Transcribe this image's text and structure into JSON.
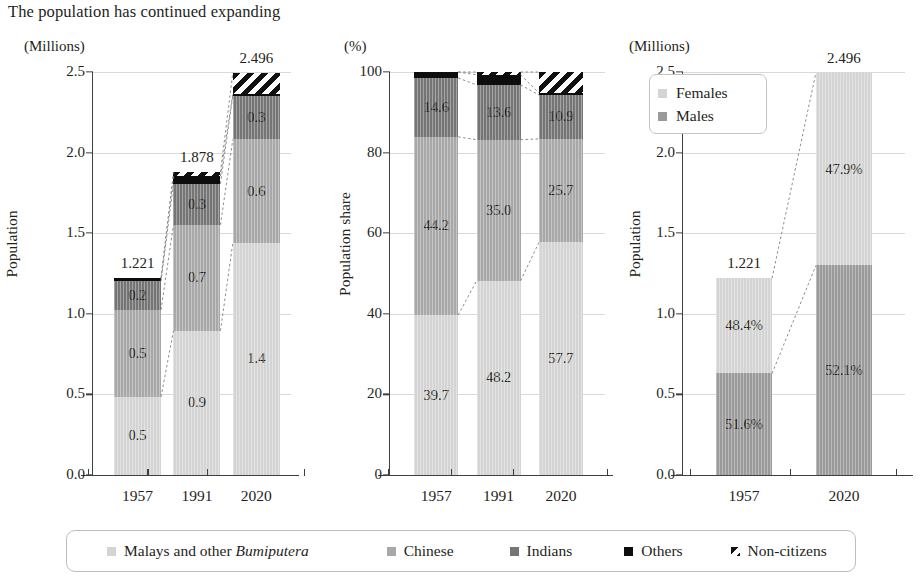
{
  "title": "The population has continued expanding",
  "colors": {
    "malays": "#d4d4d4",
    "chinese": "#a8a8a8",
    "indians": "#757575",
    "others": "#0d0d0d",
    "noncitizens": "#ffffff",
    "females": "#d4d4d4",
    "males": "#9a9a9a",
    "gridline": "#d9d9d9",
    "axis": "#3f3f3f"
  },
  "legend": {
    "items": [
      {
        "label_pre": "Malays and other ",
        "label_em": "Bumiputera",
        "label_post": "",
        "swatch": "malays"
      },
      {
        "label_pre": "Chinese",
        "label_em": "",
        "label_post": "",
        "swatch": "chinese"
      },
      {
        "label_pre": "Indians",
        "label_em": "",
        "label_post": "",
        "swatch": "indians"
      },
      {
        "label_pre": "Others",
        "label_em": "",
        "label_post": "",
        "swatch": "others"
      },
      {
        "label_pre": "Non-citizens",
        "label_em": "",
        "label_post": "",
        "swatch": "noncitizens"
      }
    ]
  },
  "chart_data": [
    {
      "id": "panel1",
      "type": "bar",
      "stacked": true,
      "unit_label": "(Millions)",
      "ylabel": "Population",
      "xlabel": "",
      "ylim": [
        0,
        2.5
      ],
      "yticks": [
        "0.0",
        "0.5",
        "1.0",
        "1.5",
        "2.0",
        "2.5"
      ],
      "ytick_values": [
        0,
        0.5,
        1.0,
        1.5,
        2.0,
        2.5
      ],
      "grid": true,
      "categories": [
        "1957",
        "1991",
        "2020"
      ],
      "series": [
        {
          "name": "Malays and other Bumiputera",
          "key": "malays",
          "values": [
            0.485,
            0.895,
            1.44
          ],
          "labels": [
            "0.5",
            "0.9",
            "1.4"
          ]
        },
        {
          "name": "Chinese",
          "key": "chinese",
          "values": [
            0.54,
            0.657,
            0.642
          ],
          "labels": [
            "0.5",
            "0.7",
            "0.6"
          ]
        },
        {
          "name": "Indians",
          "key": "indians",
          "values": [
            0.178,
            0.255,
            0.272
          ],
          "labels": [
            "0.2",
            "0.3",
            "0.3"
          ]
        },
        {
          "name": "Others",
          "key": "others",
          "values": [
            0.018,
            0.047,
            0.012
          ],
          "labels": [
            "",
            "",
            ""
          ]
        },
        {
          "name": "Non-citizens",
          "key": "noncitizens",
          "values": [
            0.0,
            0.024,
            0.13
          ],
          "labels": [
            "",
            "",
            ""
          ]
        }
      ],
      "totals": [
        "1.221",
        "1.878",
        "2.496"
      ],
      "total_values": [
        1.221,
        1.878,
        2.496
      ]
    },
    {
      "id": "panel2",
      "type": "bar",
      "stacked": true,
      "unit_label": "(%)",
      "ylabel": "Population share",
      "xlabel": "",
      "ylim": [
        0,
        100
      ],
      "yticks": [
        "0",
        "20",
        "40",
        "60",
        "80",
        "100"
      ],
      "ytick_values": [
        0,
        20,
        40,
        60,
        80,
        100
      ],
      "grid": true,
      "categories": [
        "1957",
        "1991",
        "2020"
      ],
      "series": [
        {
          "name": "Malays and other Bumiputera",
          "key": "malays",
          "values": [
            39.7,
            48.2,
            57.7
          ],
          "labels": [
            "39.7",
            "48.2",
            "57.7"
          ]
        },
        {
          "name": "Chinese",
          "key": "chinese",
          "values": [
            44.2,
            35.0,
            25.7
          ],
          "labels": [
            "44.2",
            "35.0",
            "25.7"
          ]
        },
        {
          "name": "Indians",
          "key": "indians",
          "values": [
            14.6,
            13.6,
            10.9
          ],
          "labels": [
            "14.6",
            "13.6",
            "10.9"
          ]
        },
        {
          "name": "Others",
          "key": "others",
          "values": [
            1.5,
            2.5,
            0.5
          ],
          "labels": [
            "",
            "",
            ""
          ]
        },
        {
          "name": "Non-citizens",
          "key": "noncitizens",
          "values": [
            0.0,
            0.7,
            5.2
          ],
          "labels": [
            "",
            "",
            ""
          ]
        }
      ],
      "totals": [
        "",
        "",
        ""
      ],
      "total_values": [
        100,
        100,
        100
      ]
    },
    {
      "id": "panel3",
      "type": "bar",
      "stacked": true,
      "unit_label": "(Millions)",
      "ylabel": "Population",
      "xlabel": "",
      "ylim": [
        0,
        2.5
      ],
      "yticks": [
        "0.0",
        "0.5",
        "1.0",
        "1.5",
        "2.0",
        "2.5"
      ],
      "ytick_values": [
        0,
        0.5,
        1.0,
        1.5,
        2.0,
        2.5
      ],
      "grid": true,
      "categories": [
        "1957",
        "2020"
      ],
      "legend_inside": {
        "position": "top-left",
        "items": [
          "Females",
          "Males"
        ]
      },
      "series": [
        {
          "name": "Males",
          "key": "males",
          "values": [
            0.63,
            1.3
          ],
          "labels": [
            "51.6%",
            "52.1%"
          ]
        },
        {
          "name": "Females",
          "key": "females",
          "values": [
            0.591,
            1.196
          ],
          "labels": [
            "48.4%",
            "47.9%"
          ]
        }
      ],
      "totals": [
        "1.221",
        "2.496"
      ],
      "total_values": [
        1.221,
        2.496
      ]
    }
  ]
}
